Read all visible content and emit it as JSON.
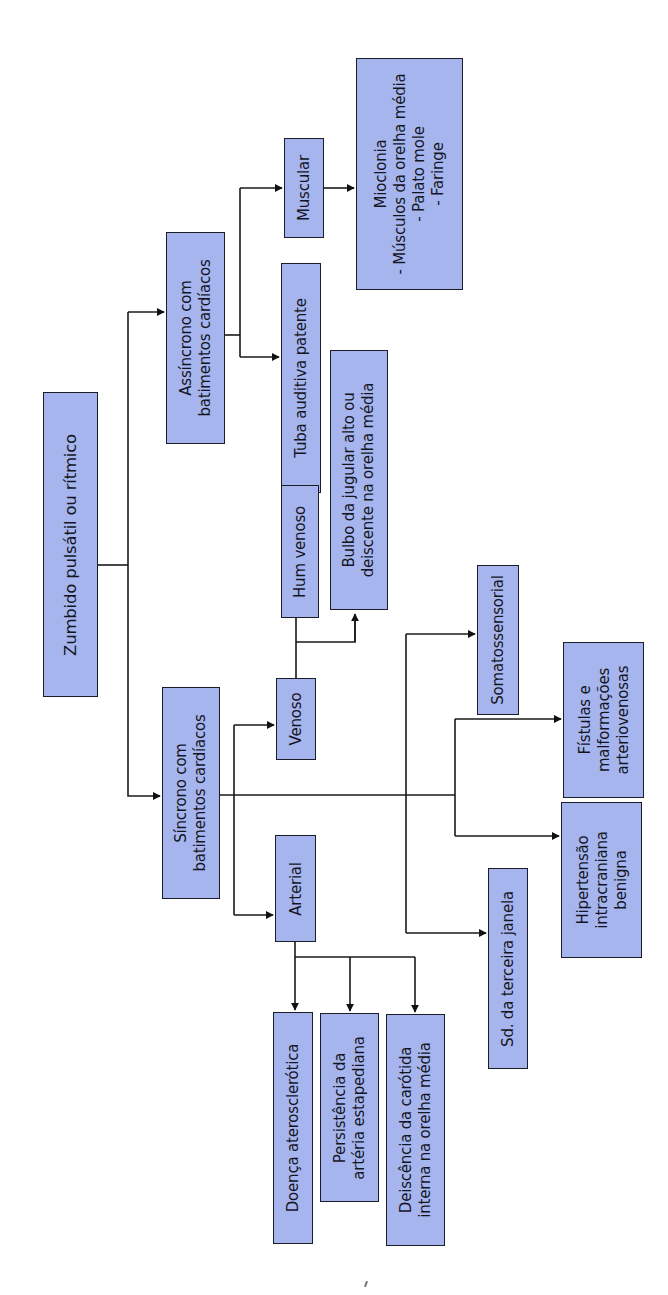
{
  "diagram": {
    "title": "Zumbido pulsátil ou rítmico",
    "orientation": "rotated 90° counter-clockwise (text reads bottom-to-top)",
    "colors": {
      "box_fill": "#a6b5ee",
      "box_border": "#1c1c28",
      "line": "#1a1a1a",
      "background": "#ffffff"
    },
    "nodes": {
      "root": "Zumbido pulsátil ou rítmico",
      "assincrono": "Assíncrono com\nbatimentos cardíacos",
      "sincrono": "Síncrono com\nbatimentos cardíacos",
      "muscular": "Muscular",
      "tuba": "Tuba auditiva patente",
      "mioclonia": "Mioclonia\n- Músculos da orelha média\n- Palato mole\n- Faringe",
      "venoso": "Venoso",
      "hum_venoso": "Hum venoso",
      "bulbo": "Bulbo da jugular alto ou\ndeiscente na orelha média",
      "arterial": "Arterial",
      "doenca": "Doença aterosclerótica",
      "persistencia": "Persistência da\nartéria estapediana",
      "deiscencia": "Deiscência da carótida\ninterna na orelha média",
      "somatossensorial": "Somatossensorial",
      "fistulas": "Fístulas e\nmalformações\narteriovenosas",
      "hipertensao": "Hipertensão\nintracraniana\nbenigna",
      "terceira_janela": "Sd. da terceira janela"
    },
    "edges": [
      [
        "root",
        "assincrono"
      ],
      [
        "root",
        "sincrono"
      ],
      [
        "assincrono",
        "muscular"
      ],
      [
        "assincrono",
        "tuba"
      ],
      [
        "muscular",
        "mioclonia"
      ],
      [
        "sincrono",
        "venoso"
      ],
      [
        "sincrono",
        "arterial"
      ],
      [
        "sincrono",
        "somatossensorial"
      ],
      [
        "sincrono",
        "fistulas"
      ],
      [
        "sincrono",
        "hipertensao"
      ],
      [
        "sincrono",
        "terceira_janela"
      ],
      [
        "venoso",
        "hum_venoso"
      ],
      [
        "venoso",
        "bulbo"
      ],
      [
        "arterial",
        "doenca"
      ],
      [
        "arterial",
        "persistencia"
      ],
      [
        "arterial",
        "deiscencia"
      ]
    ]
  }
}
